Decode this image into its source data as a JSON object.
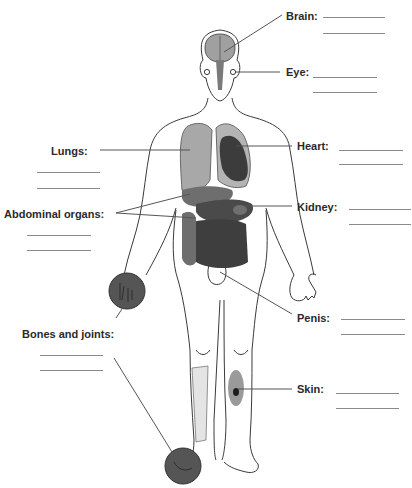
{
  "diagram": {
    "type": "human body organ labeling worksheet",
    "labels": [
      {
        "id": "brain",
        "text": "Brain:",
        "x": 286,
        "y": 10,
        "blanks": [
          {
            "x": 323,
            "y": 17,
            "w": 62
          },
          {
            "x": 323,
            "y": 33,
            "w": 62
          }
        ]
      },
      {
        "id": "eye",
        "text": "Eye:",
        "x": 286,
        "y": 66,
        "blanks": [
          {
            "x": 313,
            "y": 77,
            "w": 64
          },
          {
            "x": 313,
            "y": 92,
            "w": 64
          }
        ]
      },
      {
        "id": "heart",
        "text": "Heart:",
        "x": 297,
        "y": 140,
        "blanks": [
          {
            "x": 339,
            "y": 150,
            "w": 64
          },
          {
            "x": 339,
            "y": 164,
            "w": 64
          }
        ]
      },
      {
        "id": "kidney",
        "text": "Kidney:",
        "x": 297,
        "y": 201,
        "blanks": [
          {
            "x": 349,
            "y": 209,
            "w": 62
          },
          {
            "x": 349,
            "y": 224,
            "w": 62
          }
        ]
      },
      {
        "id": "lungs",
        "text": "Lungs:",
        "x": 51,
        "y": 145,
        "blanks": [
          {
            "x": 37,
            "y": 172,
            "w": 63
          },
          {
            "x": 37,
            "y": 188,
            "w": 63
          }
        ]
      },
      {
        "id": "abdominal",
        "text": "Abdominal organs:",
        "x": 4,
        "y": 208,
        "blanks": [
          {
            "x": 27,
            "y": 235,
            "w": 64
          },
          {
            "x": 27,
            "y": 250,
            "w": 64
          }
        ]
      },
      {
        "id": "bones",
        "text": "Bones and joints:",
        "x": 22,
        "y": 328,
        "blanks": [
          {
            "x": 40,
            "y": 355,
            "w": 63
          },
          {
            "x": 40,
            "y": 370,
            "w": 63
          }
        ]
      },
      {
        "id": "penis",
        "text": "Penis:",
        "x": 297,
        "y": 312,
        "blanks": [
          {
            "x": 341,
            "y": 319,
            "w": 64
          },
          {
            "x": 341,
            "y": 334,
            "w": 64
          }
        ]
      },
      {
        "id": "skin",
        "text": "Skin:",
        "x": 297,
        "y": 383,
        "blanks": [
          {
            "x": 336,
            "y": 393,
            "w": 63
          },
          {
            "x": 336,
            "y": 408,
            "w": 63
          }
        ]
      }
    ],
    "colors": {
      "outline": "#3a3a3a",
      "lung": "#a8a8a8",
      "heart": "#3c3c3c",
      "organ_mid": "#6e6e6e",
      "organ_dark": "#4a4a4a",
      "joint_circle": "#555555",
      "bone": "#e4e4e4",
      "skin_patch": "#9a9a9a",
      "skin_lesion": "#1e1e1e",
      "leader_line": "#555555"
    }
  }
}
